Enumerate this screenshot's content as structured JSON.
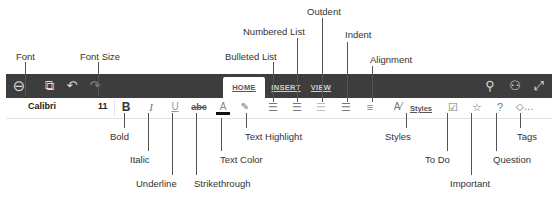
{
  "toolbar": {
    "left_icons": [
      "back-icon",
      "sync-icon",
      "undo-icon",
      "redo-icon"
    ],
    "tabs": [
      {
        "label": "HOME",
        "active": true
      },
      {
        "label": "INSERT",
        "active": false
      },
      {
        "label": "VIEW",
        "active": false
      }
    ],
    "right_icons": [
      "search-icon",
      "share-user-icon",
      "expand-icon"
    ],
    "background_color": "#3d3d3d"
  },
  "format_bar": {
    "font": "Calibri",
    "font_size": "11",
    "bold": "B",
    "italic": "I",
    "underline": "U",
    "strikethrough": "abc",
    "text_color": "A",
    "styles_label": "Styles",
    "question": "?"
  },
  "callouts": {
    "font": "Font",
    "font_size": "Font Size",
    "bulleted_list": "Bulleted List",
    "numbered_list": "Numbered List",
    "outdent": "Outdent",
    "indent": "Indent",
    "alignment": "Alignment",
    "bold": "Bold",
    "italic": "Italic",
    "underline": "Underline",
    "strikethrough": "Strikethrough",
    "text_color": "Text Color",
    "text_highlight": "Text Highlight",
    "styles": "Styles",
    "to_do": "To Do",
    "important": "Important",
    "question": "Question",
    "tags": "Tags"
  }
}
